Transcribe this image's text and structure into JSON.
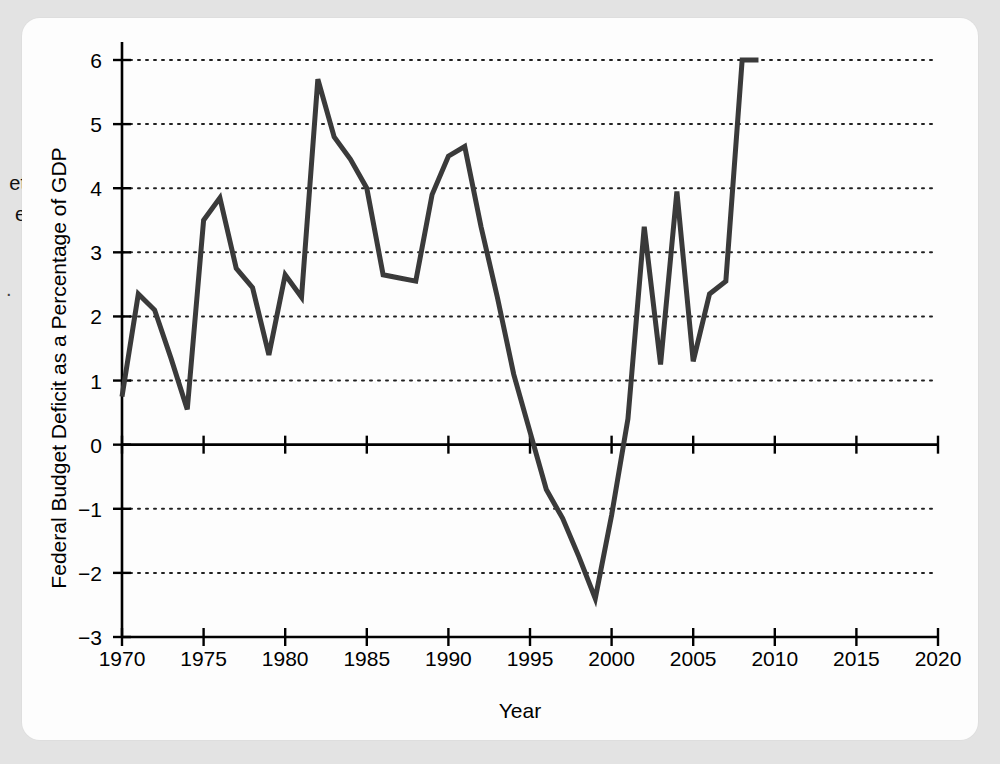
{
  "page": {
    "bleed_text_lines": [
      "et",
      "e"
    ],
    "bleed_marker": "."
  },
  "figure": {
    "x_axis_title": "Year",
    "y_axis_title": "Federal Budget Deficit as a Percentage of GDP"
  },
  "chart_data": {
    "type": "line",
    "title": "",
    "xlabel": "Year",
    "ylabel": "Federal Budget Deficit as a Percentage of GDP",
    "xlim": [
      1970,
      2020
    ],
    "ylim": [
      -3,
      6
    ],
    "xticks": [
      1970,
      1975,
      1980,
      1985,
      1990,
      1995,
      2000,
      2005,
      2010,
      2015,
      2020
    ],
    "yticks": [
      -3,
      -2,
      -1,
      0,
      1,
      2,
      3,
      4,
      5,
      6
    ],
    "xtick_labels": [
      "1970",
      "1975",
      "1980",
      "1985",
      "1990",
      "1995",
      "2000",
      "2005",
      "2010",
      "2015",
      "2020"
    ],
    "ytick_labels": [
      "−3",
      "−2",
      "−1",
      "0",
      "1",
      "2",
      "3",
      "4",
      "5",
      "6"
    ],
    "grid": "horizontal-dotted",
    "zero_line": true,
    "legend": "none",
    "line_color": "#3a3a3a",
    "line_width": 5,
    "x": [
      1970,
      1971,
      1972,
      1973,
      1974,
      1975,
      1976,
      1977,
      1978,
      1979,
      1980,
      1981,
      1982,
      1983,
      1984,
      1985,
      1986,
      1987,
      1988,
      1989,
      1990,
      1991,
      1992,
      1993,
      1994,
      1995,
      1996,
      1997,
      1998,
      1999,
      2000,
      2001,
      2002,
      2003,
      2004,
      2005,
      2006,
      2007,
      2008,
      2009
    ],
    "values": [
      0.75,
      2.35,
      2.1,
      1.35,
      0.55,
      3.5,
      3.85,
      2.75,
      2.45,
      1.4,
      2.65,
      2.3,
      5.7,
      4.8,
      4.45,
      4.0,
      2.65,
      2.6,
      2.55,
      3.9,
      4.5,
      4.65,
      3.4,
      2.3,
      1.1,
      0.2,
      -0.7,
      -1.15,
      -1.75,
      -2.4,
      -1.1,
      0.4,
      3.4,
      1.25,
      3.95,
      1.3,
      2.35,
      2.55,
      6.0,
      6.0
    ]
  }
}
